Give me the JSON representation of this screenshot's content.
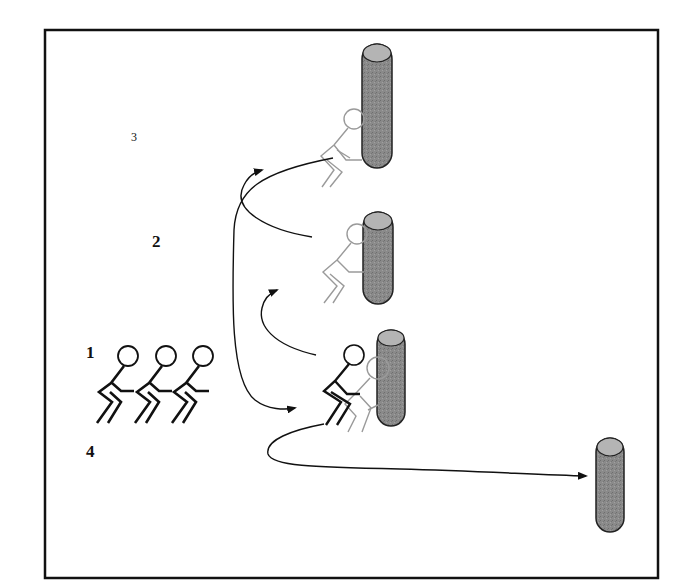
{
  "diagram": {
    "type": "drill diagram",
    "labels": {
      "one": "1",
      "two": "2",
      "three": "3",
      "four": "4"
    },
    "elements": {
      "waiting_players": 3,
      "tackle_bags": 4,
      "active_players": 3
    },
    "colors": {
      "frame": "#111111",
      "bag_fill": "#8a8a8a",
      "bag_top": "#b4b4b4",
      "player_active": "#111111",
      "player_ghost": "#9a9a9a",
      "arrow": "#111111"
    }
  }
}
